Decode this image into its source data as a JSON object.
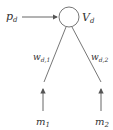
{
  "diagram": {
    "type": "network-node",
    "input_label": {
      "base": "p",
      "sub": "d"
    },
    "node_label": {
      "base": "V",
      "sub": "d"
    },
    "edges": [
      {
        "label": {
          "base": "w",
          "sub": "d,1"
        },
        "source": {
          "base": "m",
          "sub": "1"
        }
      },
      {
        "label": {
          "base": "w",
          "sub": "d,2"
        },
        "source": {
          "base": "m",
          "sub": "2"
        }
      }
    ],
    "colors": {
      "stroke": "#555555",
      "text": "#333333",
      "background": "#ffffff"
    }
  }
}
